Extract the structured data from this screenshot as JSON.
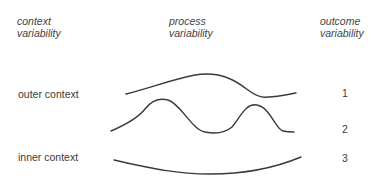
{
  "headers": {
    "context": [
      "context",
      "variability"
    ],
    "process": [
      "process",
      "variability"
    ],
    "outcome": [
      "outcome",
      "variability"
    ]
  },
  "labels": {
    "outer": "outer context",
    "inner": "inner context"
  },
  "outcomes": [
    "1",
    "2",
    "3"
  ],
  "colors": {
    "stroke": "#3a3a3a",
    "text": "#3a3a3a",
    "background": "#ffffff"
  }
}
